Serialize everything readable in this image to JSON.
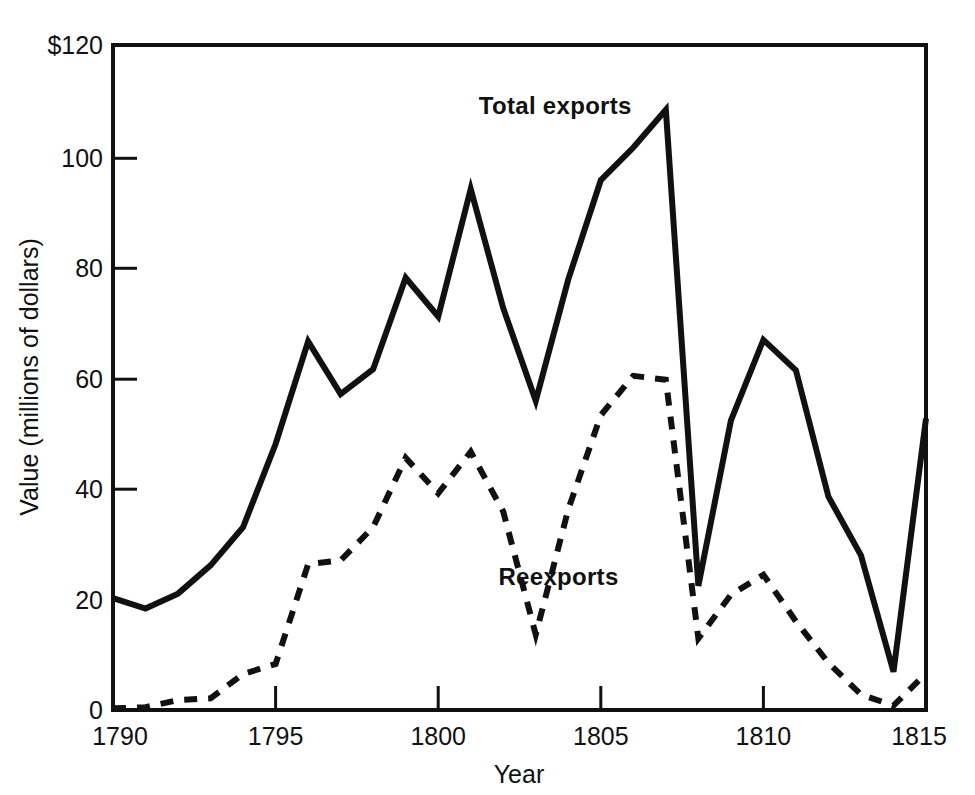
{
  "chart_data": {
    "type": "line",
    "title": "",
    "xlabel": "Year",
    "ylabel": "Value (millions of dollars)",
    "xlim": [
      1790,
      1815
    ],
    "ylim": [
      0,
      120
    ],
    "xticks": [
      1790,
      1795,
      1800,
      1805,
      1810,
      1815
    ],
    "xtick_labels": [
      "1790",
      "1795",
      "1800",
      "1805",
      "1810",
      "1815"
    ],
    "yticks": [
      0,
      20,
      40,
      60,
      80,
      100,
      120
    ],
    "ytick_labels": [
      "0",
      "20",
      "40",
      "60",
      "80",
      "100",
      "$120"
    ],
    "grid": false,
    "legend_position": "inline-annotations",
    "x": [
      1790,
      1791,
      1792,
      1793,
      1794,
      1795,
      1796,
      1797,
      1798,
      1799,
      1800,
      1801,
      1802,
      1803,
      1804,
      1805,
      1806,
      1807,
      1808,
      1809,
      1810,
      1811,
      1812,
      1813,
      1814,
      1815
    ],
    "series": [
      {
        "name": "Total exports",
        "style": "solid",
        "color": "#111111",
        "values": [
          20.2,
          18.3,
          21.0,
          26.1,
          33.0,
          48.0,
          66.5,
          57.0,
          61.5,
          78.0,
          71.0,
          94.0,
          72.5,
          55.8,
          77.7,
          95.6,
          101.5,
          108.3,
          22.4,
          52.2,
          66.8,
          61.3,
          38.5,
          27.9,
          6.9,
          52.6
        ],
        "label_annotation": "Total exports"
      },
      {
        "name": "Reexports",
        "style": "dashed",
        "color": "#111111",
        "values": [
          0.3,
          0.5,
          1.8,
          2.1,
          6.5,
          8.3,
          26.3,
          27.0,
          33.0,
          45.5,
          39.1,
          46.6,
          35.8,
          13.6,
          36.2,
          53.2,
          60.3,
          59.6,
          12.9,
          20.8,
          24.4,
          16.0,
          8.5,
          2.8,
          0.8,
          6.6
        ]
      }
    ],
    "annotations": [
      {
        "text": "Total exports",
        "x": 1803.6,
        "y": 107.5
      },
      {
        "text": "Reexports",
        "x": 1803.7,
        "y": 22.5
      }
    ]
  },
  "axes": {
    "x_axis_title": "Year",
    "y_axis_title": "Value (millions of dollars)"
  }
}
